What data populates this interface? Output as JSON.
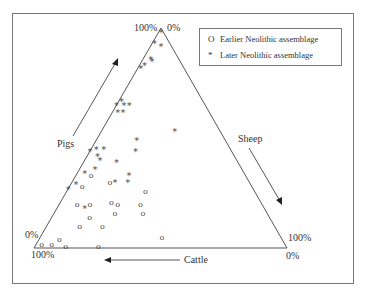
{
  "chart_data": {
    "type": "scatter",
    "subtype": "ternary",
    "title": "",
    "axes": {
      "pigs": {
        "label": "Pigs",
        "apex_label": "100%",
        "base_label": "0%"
      },
      "sheep": {
        "label": "Sheep",
        "apex_label": "0%",
        "corner_label": "100%"
      },
      "cattle": {
        "label": "Cattle",
        "left_corner_label": "100%",
        "right_corner_label": "0%"
      }
    },
    "corner_labels": {
      "top_left": "100%",
      "top_right": "0%",
      "left_upper": "0%",
      "left_lower": "100%",
      "right_upper": "100%",
      "right_lower": "0%"
    },
    "legend": [
      {
        "symbol": "O",
        "label": "Earlier Neolithic assemblage"
      },
      {
        "symbol": "*",
        "label": "Later Neolithic assemblage"
      }
    ],
    "legend_position": "top-right",
    "value_order": [
      "pigs_pct",
      "sheep_pct",
      "cattle_pct"
    ],
    "series": [
      {
        "name": "Earlier Neolithic assemblage",
        "marker": "O",
        "points": [
          [
            33,
            6,
            61
          ],
          [
            28,
            5,
            67
          ],
          [
            30,
            15,
            55
          ],
          [
            26,
            31,
            43
          ],
          [
            20,
            7,
            73
          ],
          [
            20,
            12,
            68
          ],
          [
            21,
            20,
            59
          ],
          [
            20,
            23,
            57
          ],
          [
            16,
            24,
            60
          ],
          [
            20,
            32,
            48
          ],
          [
            16,
            35,
            49
          ],
          [
            14,
            15,
            71
          ],
          [
            10,
            13,
            77
          ],
          [
            10,
            22,
            68
          ],
          [
            5,
            48,
            47
          ],
          [
            2,
            2,
            96
          ],
          [
            2,
            6,
            92
          ],
          [
            4,
            8,
            88
          ],
          [
            1,
            12,
            87
          ],
          [
            1,
            25,
            74
          ]
        ]
      },
      {
        "name": "Later Neolithic assemblage",
        "marker": "*",
        "points": [
          [
            98,
            1,
            1
          ],
          [
            93,
            1,
            6
          ],
          [
            92,
            4,
            4
          ],
          [
            86,
            3,
            11
          ],
          [
            85,
            4,
            11
          ],
          [
            82,
            1,
            17
          ],
          [
            83,
            2,
            15
          ],
          [
            67,
            1,
            32
          ],
          [
            65,
            0,
            35
          ],
          [
            65,
            3,
            32
          ],
          [
            65,
            5,
            30
          ],
          [
            62,
            2,
            36
          ],
          [
            62,
            4,
            34
          ],
          [
            53,
            29,
            18
          ],
          [
            49,
            16,
            35
          ],
          [
            44,
            18,
            38
          ],
          [
            45,
            2,
            53
          ],
          [
            44,
            0,
            56
          ],
          [
            42,
            4,
            54
          ],
          [
            40,
            6,
            54
          ],
          [
            45,
            5,
            50
          ],
          [
            39,
            13,
            48
          ],
          [
            34,
            3,
            63
          ],
          [
            36,
            6,
            58
          ],
          [
            30,
            17,
            53
          ],
          [
            33,
            21,
            46
          ],
          [
            30,
            22,
            48
          ],
          [
            27,
            0,
            73
          ],
          [
            29,
            2,
            69
          ],
          [
            18,
            11,
            71
          ]
        ]
      }
    ],
    "grid": false
  },
  "colors": {
    "line": "#555555",
    "marker": "#444444",
    "frame": "#777777",
    "background": "#ffffff"
  }
}
